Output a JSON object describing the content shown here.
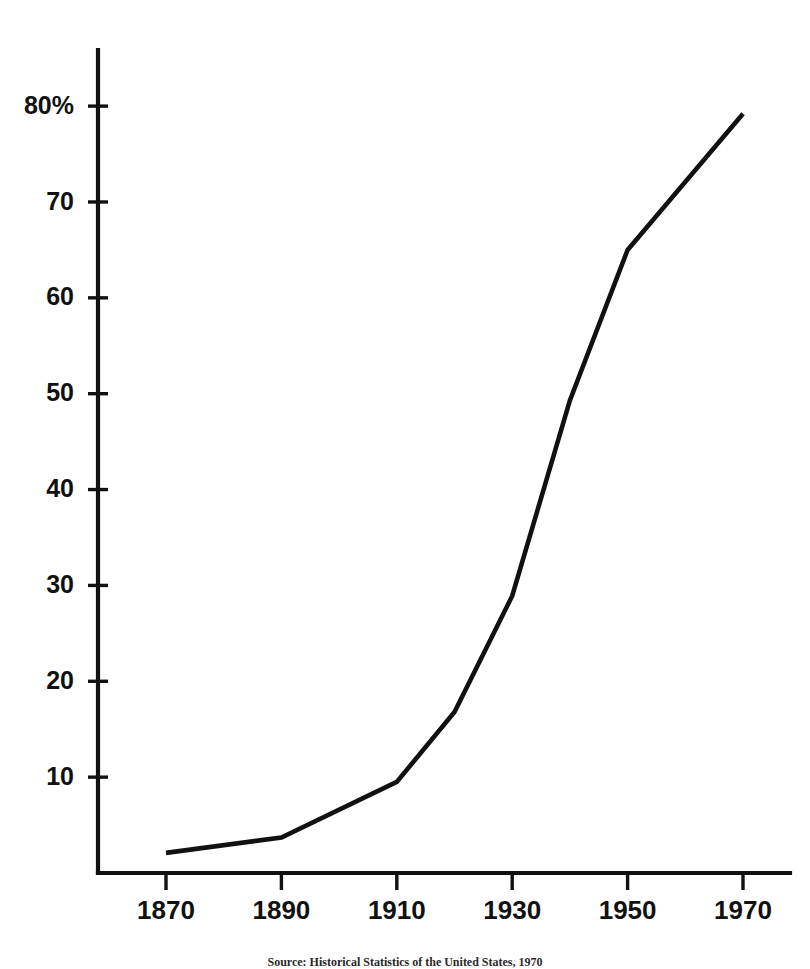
{
  "chart_data": {
    "type": "line",
    "title": "",
    "subtitle": "",
    "xlabel": "",
    "ylabel": "",
    "x": [
      1870,
      1890,
      1910,
      1920,
      1930,
      1940,
      1950,
      1970
    ],
    "values": [
      2.1,
      3.7,
      9.5,
      16.8,
      28.9,
      49.3,
      65.0,
      79.2
    ],
    "series": [
      {
        "name": "Percent of population",
        "values": [
          2.1,
          3.7,
          9.5,
          16.8,
          28.9,
          49.3,
          65.0,
          79.2
        ]
      }
    ],
    "xlim": [
      1860,
      1972
    ],
    "ylim": [
      0,
      85
    ],
    "xticks": [
      1870,
      1890,
      1910,
      1930,
      1950,
      1970
    ],
    "xtick_labels": [
      "1870",
      "1890",
      "1910",
      "1930",
      "1950",
      "1970"
    ],
    "yticks": [
      10,
      20,
      30,
      40,
      50,
      60,
      70,
      80
    ],
    "ytick_labels": [
      "10",
      "20",
      "30",
      "40",
      "50",
      "60",
      "70",
      "80%"
    ],
    "grid": false,
    "legend": false,
    "legend_position": "none",
    "line_color": "#111111",
    "background_color": "#ffffff",
    "annotations": []
  },
  "caption": {
    "source_text": "Source: Historical Statistics of the United States, 1970"
  },
  "axes": {
    "y_axis_name": "percent-axis",
    "x_axis_name": "year-axis"
  }
}
